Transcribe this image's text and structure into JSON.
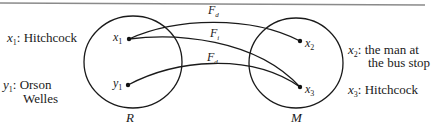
{
  "diagram": {
    "sets": [
      {
        "id": "R",
        "label": "R"
      },
      {
        "id": "M",
        "label": "M"
      }
    ],
    "points": [
      {
        "id": "x1",
        "var": "x",
        "sub": "1",
        "set": "R"
      },
      {
        "id": "y1",
        "var": "y",
        "sub": "1",
        "set": "R"
      },
      {
        "id": "x2",
        "var": "x",
        "sub": "2",
        "set": "M"
      },
      {
        "id": "x3",
        "var": "x",
        "sub": "3",
        "set": "M"
      }
    ],
    "arrows": [
      {
        "from": "x1",
        "to": "x2",
        "label": "F",
        "sub": "d"
      },
      {
        "from": "x1",
        "to": "x3",
        "label": "F",
        "sub": "i"
      },
      {
        "from": "y1",
        "to": "x3",
        "label": "F",
        "sub": "d"
      }
    ],
    "legend": {
      "x1": {
        "var": "x",
        "sub": "1",
        "text": ": Hitchcock"
      },
      "y1": {
        "var": "y",
        "sub": "1",
        "text_line1": ": Orson",
        "text_line2": "Welles"
      },
      "x2": {
        "var": "x",
        "sub": "2",
        "text_line1": ": the man at",
        "text_line2": "the bus stop"
      },
      "x3": {
        "var": "x",
        "sub": "3",
        "text": ": Hitchcock"
      }
    }
  }
}
